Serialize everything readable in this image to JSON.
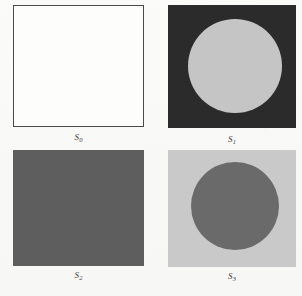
{
  "figure": {
    "background_color": "#f8f8f6",
    "layout": "2x2 grid of image panels with italic serif captions below each panel",
    "panels": [
      {
        "id": "s0",
        "label_base": "S",
        "label_sub": "0",
        "label": "S0",
        "square_fill": "#fdfdfc",
        "square_stroke": "#4a4a4a",
        "has_circle": false,
        "circle_fill": "",
        "description": "white square with thin dark outline, no circle"
      },
      {
        "id": "s1",
        "label_base": "S",
        "label_sub": "1",
        "label": "S1",
        "square_fill": "#2b2b2b",
        "square_stroke": "",
        "has_circle": true,
        "circle_fill": "#c5c5c5",
        "description": "near-black square containing a large light gray circle"
      },
      {
        "id": "s2",
        "label_base": "S",
        "label_sub": "2",
        "label": "S2",
        "square_fill": "#5e5e5e",
        "square_stroke": "",
        "has_circle": false,
        "circle_fill": "",
        "description": "solid medium gray square, no circle"
      },
      {
        "id": "s3",
        "label_base": "S",
        "label_sub": "3",
        "label": "S3",
        "square_fill": "#c9c9c9",
        "square_stroke": "",
        "has_circle": true,
        "circle_fill": "#6a6a6a",
        "description": "light gray square containing a medium gray circle"
      }
    ]
  }
}
